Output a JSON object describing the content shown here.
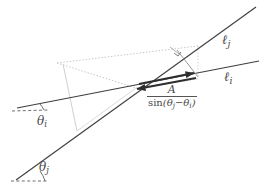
{
  "figure": {
    "type": "geometry-diagram",
    "background_color": "#ffffff",
    "stroke_color": "#3f3f3f",
    "faint_stroke_color": "#b9b9b9",
    "labels": {
      "line_j": {
        "symbol": "ℓ",
        "subscript": "j",
        "text": "ℓj"
      },
      "line_i": {
        "symbol": "ℓ",
        "subscript": "i",
        "text": "ℓi"
      },
      "angle_i": {
        "symbol": "θ",
        "subscript": "i",
        "text": "θi"
      },
      "angle_j": {
        "symbol": "θ",
        "subscript": "j",
        "text": "θj"
      },
      "vector_magnitude": {
        "numerator": "A",
        "denominator_function": "sin",
        "denominator_expression": "(θj − θi)",
        "denominator_theta_1": "θ",
        "denominator_sub_1": "j",
        "minus": "−",
        "denominator_theta_2": "θ",
        "denominator_sub_2": "i",
        "text": "A / sin(θj − θi)"
      }
    },
    "geometry": {
      "line_i": {
        "x1": 17,
        "y1": 108,
        "x2": 259,
        "y2": 61
      },
      "line_j": {
        "x1": 16,
        "y1": 179,
        "x2": 256,
        "y2": 7
      },
      "intersection": {
        "x": 136,
        "y": 88
      },
      "dashed_ref_i": {
        "x1": 14,
        "y1": 111,
        "x2": 47,
        "y2": 111
      },
      "dashed_ref_j": {
        "x1": 13,
        "y1": 180,
        "x2": 45,
        "y2": 180
      },
      "arrow_right": {
        "x1": 137,
        "y1": 84,
        "x2": 196,
        "y2": 73
      },
      "arrow_left": {
        "x1": 196,
        "y1": 78,
        "x2": 134,
        "y2": 89
      },
      "perpendicular": {
        "x1": 178,
        "y1": 51,
        "x2": 196,
        "y2": 74
      },
      "right_angle_marker": {
        "x": 178,
        "y": 51
      },
      "dotted_parallel_upper": {
        "x1": 57,
        "y1": 63,
        "x2": 196,
        "y2": 46
      },
      "dotted_parallel_lower": {
        "x1": 62,
        "y1": 66,
        "x2": 198,
        "y2": 79
      },
      "faint_connector_left": {
        "x1": 63,
        "y1": 64,
        "x2": 74,
        "y2": 128
      },
      "faint_connector_mid": {
        "x1": 176,
        "y1": 50,
        "x2": 197,
        "y2": 77
      }
    }
  }
}
